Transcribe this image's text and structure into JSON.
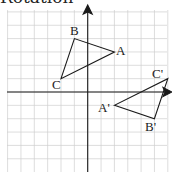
{
  "title": "Rotation",
  "grid": {
    "spacing_px": 13.35,
    "origin_px": [
      87.7,
      92
    ],
    "x_range": [
      -6,
      6
    ],
    "y_range": [
      -6,
      6
    ],
    "line_color": "#c8c8c8",
    "axis_color": "#222222"
  },
  "triangles": [
    {
      "name": "original",
      "vertices": [
        {
          "label": "A",
          "x": 2,
          "y": 3
        },
        {
          "label": "B",
          "x": -1,
          "y": 4
        },
        {
          "label": "C",
          "x": -2,
          "y": 1
        }
      ]
    },
    {
      "name": "image",
      "vertices": [
        {
          "label": "A'",
          "x": 2,
          "y": -1
        },
        {
          "label": "B'",
          "x": 5,
          "y": -2
        },
        {
          "label": "C'",
          "x": 6,
          "y": 1
        }
      ]
    }
  ],
  "labels": {
    "A": "A",
    "B": "B",
    "C": "C",
    "A_prime": "A'",
    "B_prime": "B'",
    "C_prime": "C'"
  }
}
